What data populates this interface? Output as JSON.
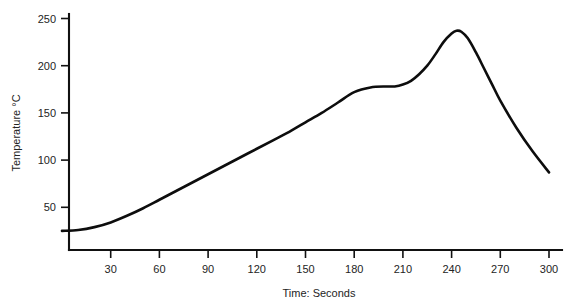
{
  "chart_data": {
    "type": "line",
    "title": "",
    "subtitle": "",
    "xlabel": "Time: Seconds",
    "ylabel": "Temperature °C",
    "xlim": [
      0,
      300
    ],
    "ylim": [
      0,
      250
    ],
    "grid": false,
    "legend": null,
    "legend_position": "none",
    "x_ticks": [
      30,
      60,
      90,
      120,
      150,
      180,
      210,
      240,
      270,
      300
    ],
    "x_tick_labels": [
      "30",
      "60",
      "90",
      "120",
      "150",
      "180",
      "210",
      "240",
      "270",
      "300"
    ],
    "y_ticks": [
      50,
      100,
      150,
      200,
      250
    ],
    "y_tick_labels": [
      "50",
      "100",
      "150",
      "200",
      "250"
    ],
    "series": [
      {
        "name": "Reflow thermal profile",
        "color": "#0d0d0d",
        "x": [
          0,
          10,
          20,
          30,
          40,
          50,
          60,
          70,
          80,
          90,
          100,
          110,
          120,
          130,
          140,
          150,
          160,
          170,
          180,
          190,
          200,
          205,
          210,
          215,
          220,
          225,
          230,
          235,
          240,
          243,
          246,
          250,
          255,
          260,
          265,
          270,
          280,
          290,
          300
        ],
        "y": [
          25,
          26,
          29,
          34,
          41,
          49,
          58,
          67,
          76,
          85,
          94,
          103,
          112,
          121,
          130,
          140,
          150,
          161,
          172,
          177,
          178,
          178,
          180,
          184,
          191,
          200,
          212,
          225,
          234,
          237,
          236,
          229,
          214,
          197,
          180,
          163,
          134,
          109,
          87
        ]
      }
    ],
    "annotations": [],
    "notable_points": {
      "start_temperature": 25,
      "soak_plateau_temperature": 178,
      "soak_plateau_start_seconds": 180,
      "soak_plateau_end_seconds": 205,
      "peak_temperature": 237,
      "peak_time_seconds": 243,
      "end_temperature": 87,
      "end_time_seconds": 300
    }
  },
  "axes": {
    "y_axis_name": "temperature-axis",
    "x_axis_name": "time-axis"
  }
}
